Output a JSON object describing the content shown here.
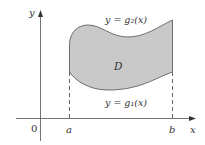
{
  "diagram": {
    "type": "region-between-curves",
    "axes": {
      "x_label": "x",
      "y_label": "y",
      "origin_label": "0"
    },
    "bounds": {
      "left_label": "a",
      "right_label": "b"
    },
    "curves": {
      "upper_label": "y = g₂(x)",
      "lower_label": "y = g₁(x)"
    },
    "region_label": "D",
    "colors": {
      "region_fill": "#c8c8c8",
      "region_stroke": "#707070",
      "axis": "#555555",
      "dashed": "#555555"
    }
  }
}
